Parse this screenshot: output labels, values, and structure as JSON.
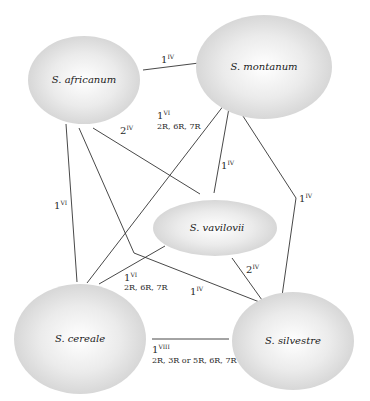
{
  "diagram": {
    "type": "species-relationship-graph",
    "nodes": {
      "africanum": {
        "label": "S. africanum",
        "cx": 84,
        "cy": 80,
        "rx": 56,
        "ry": 44
      },
      "montanum": {
        "label": "S. montanum",
        "cx": 264,
        "cy": 67,
        "rx": 68,
        "ry": 52
      },
      "vavilovii": {
        "label": "S. vavilovii",
        "cx": 215,
        "cy": 228,
        "rx": 62,
        "ry": 28
      },
      "cereale": {
        "label": "S. cereale",
        "cx": 80,
        "cy": 339,
        "rx": 66,
        "ry": 55
      },
      "silvestre": {
        "label": "S. silvestre",
        "cx": 293,
        "cy": 341,
        "rx": 61,
        "ry": 49
      }
    },
    "edges": {
      "africanum_montanum": {
        "from": "S. africanum",
        "to": "S. montanum",
        "count": "1",
        "roman": "IV",
        "chromosomes": ""
      },
      "africanum_cereale": {
        "from": "S. africanum",
        "to": "S. cereale",
        "count": "1",
        "roman": "VI",
        "chromosomes": ""
      },
      "africanum_vavilovii": {
        "from": "S. africanum",
        "to": "S. vavilovii",
        "count": "2",
        "roman": "IV",
        "chromosomes": ""
      },
      "africanum_silvestre": {
        "from": "S. africanum",
        "to": "S. silvestre",
        "count": "1",
        "roman": "IV",
        "chromosomes": ""
      },
      "montanum_cereale": {
        "from": "S. montanum",
        "to": "S. cereale",
        "count": "1",
        "roman": "VI",
        "chromosomes": "2R, 6R, 7R"
      },
      "montanum_vavilovii": {
        "from": "S. montanum",
        "to": "S. vavilovii",
        "count": "1",
        "roman": "IV",
        "chromosomes": ""
      },
      "montanum_silvestre": {
        "from": "S. montanum",
        "to": "S. silvestre",
        "count": "1",
        "roman": "IV",
        "chromosomes": ""
      },
      "vavilovii_cereale": {
        "from": "S. vavilovii",
        "to": "S. cereale",
        "count": "1",
        "roman": "VI",
        "chromosomes": "2R, 6R, 7R"
      },
      "vavilovii_silvestre": {
        "from": "S. vavilovii",
        "to": "S. silvestre",
        "count": "2",
        "roman": "IV",
        "chromosomes": ""
      },
      "cereale_silvestre": {
        "from": "S. cereale",
        "to": "S. silvestre",
        "count": "1",
        "roman": "VIII",
        "chromosomes": "2R, 3R or 5R, 6R, 7R"
      }
    },
    "colors": {
      "node_center": "#ffffff",
      "node_edge": "#d4d4d4",
      "line": "#333333",
      "text": "#1a1a1a"
    }
  }
}
